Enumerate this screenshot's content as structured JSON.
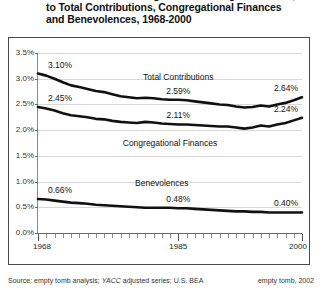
{
  "title": {
    "lines": [
      "Church Member Giving as a Percentage of Income,",
      "to Total Contributions, Congregational Finances",
      "and Benevolences, 1968-2000"
    ]
  },
  "footer": {
    "source_prefix": "Source: empty tomb analysis; ",
    "source_italic": "YACC",
    "source_suffix": " adjusted series; U.S. BEA",
    "credit": "empty tomb, 2002"
  },
  "chart_data": {
    "type": "line",
    "title": "Church Member Giving as a Percentage of Income, to Total Contributions, Congregational Finances and Benevolences, 1968-2000",
    "xlabel": "",
    "ylabel": "",
    "xlim": [
      1968,
      2000
    ],
    "ylim": [
      0.0,
      3.5
    ],
    "grid": true,
    "legend_position": "inline-annotations",
    "ytick_labels": [
      "0.0%",
      "0.5%",
      "1.0%",
      "1.5%",
      "2.0%",
      "2.5%",
      "3.0%",
      "3.5%"
    ],
    "ytick_values": [
      0.0,
      0.5,
      1.0,
      1.5,
      2.0,
      2.5,
      3.0,
      3.5
    ],
    "xtick_labels": [
      "1968",
      "1985",
      "2000"
    ],
    "xtick_values": [
      1968,
      1985,
      2000
    ],
    "line_color": "#111111",
    "grid_color": "#d8d8d8",
    "x": [
      1968,
      1969,
      1970,
      1971,
      1972,
      1973,
      1974,
      1975,
      1976,
      1977,
      1978,
      1979,
      1980,
      1981,
      1982,
      1983,
      1984,
      1985,
      1986,
      1987,
      1988,
      1989,
      1990,
      1991,
      1992,
      1993,
      1994,
      1995,
      1996,
      1997,
      1998,
      1999,
      2000
    ],
    "series": [
      {
        "name": "Total Contributions",
        "values": [
          3.1,
          3.06,
          3.0,
          2.93,
          2.87,
          2.84,
          2.8,
          2.76,
          2.74,
          2.7,
          2.66,
          2.64,
          2.62,
          2.63,
          2.62,
          2.6,
          2.59,
          2.59,
          2.58,
          2.56,
          2.54,
          2.52,
          2.5,
          2.49,
          2.46,
          2.44,
          2.45,
          2.48,
          2.46,
          2.5,
          2.53,
          2.58,
          2.64
        ],
        "annotations": [
          {
            "label": "3.10%",
            "x": 1968,
            "y": 3.1
          },
          {
            "label": "2.59%",
            "x": 1985,
            "y": 2.59
          },
          {
            "label": "2.64%",
            "x": 2000,
            "y": 2.64
          }
        ]
      },
      {
        "name": "Congregational Finances",
        "values": [
          2.45,
          2.42,
          2.38,
          2.33,
          2.29,
          2.27,
          2.25,
          2.22,
          2.21,
          2.18,
          2.16,
          2.15,
          2.14,
          2.16,
          2.15,
          2.13,
          2.12,
          2.11,
          2.11,
          2.1,
          2.09,
          2.08,
          2.07,
          2.07,
          2.05,
          2.03,
          2.05,
          2.09,
          2.07,
          2.11,
          2.14,
          2.19,
          2.24
        ],
        "annotations": [
          {
            "label": "2.45%",
            "x": 1968,
            "y": 2.45
          },
          {
            "label": "2.11%",
            "x": 1985,
            "y": 2.11
          },
          {
            "label": "2.24%",
            "x": 2000,
            "y": 2.24
          }
        ]
      },
      {
        "name": "Benevolences",
        "values": [
          0.66,
          0.65,
          0.63,
          0.61,
          0.59,
          0.58,
          0.57,
          0.55,
          0.54,
          0.53,
          0.52,
          0.51,
          0.5,
          0.49,
          0.49,
          0.49,
          0.49,
          0.48,
          0.48,
          0.47,
          0.46,
          0.45,
          0.44,
          0.43,
          0.42,
          0.42,
          0.41,
          0.41,
          0.4,
          0.4,
          0.4,
          0.4,
          0.4
        ],
        "annotations": [
          {
            "label": "0.66%",
            "x": 1968,
            "y": 0.66
          },
          {
            "label": "0.48%",
            "x": 1985,
            "y": 0.48
          },
          {
            "label": "0.40%",
            "x": 2000,
            "y": 0.4
          }
        ]
      }
    ],
    "series_labels": [
      {
        "text": "Total Contributions",
        "x": 1985,
        "y": 3.02
      },
      {
        "text": "Congregational Finances",
        "x": 1984,
        "y": 1.74
      },
      {
        "text": "Benevolences",
        "x": 1983,
        "y": 0.96
      }
    ]
  }
}
